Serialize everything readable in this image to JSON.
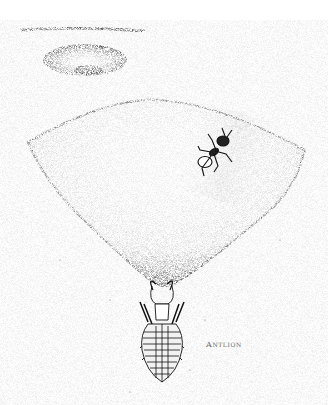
{
  "figure": {
    "caption_label": "Antlion",
    "subjects": [
      "antlion-larva",
      "ant",
      "sand-pit-cone",
      "pit-opening-top-view"
    ],
    "colors": {
      "background": "#ffffff",
      "stipple": "#222222",
      "label": "#6a6a6a"
    }
  }
}
